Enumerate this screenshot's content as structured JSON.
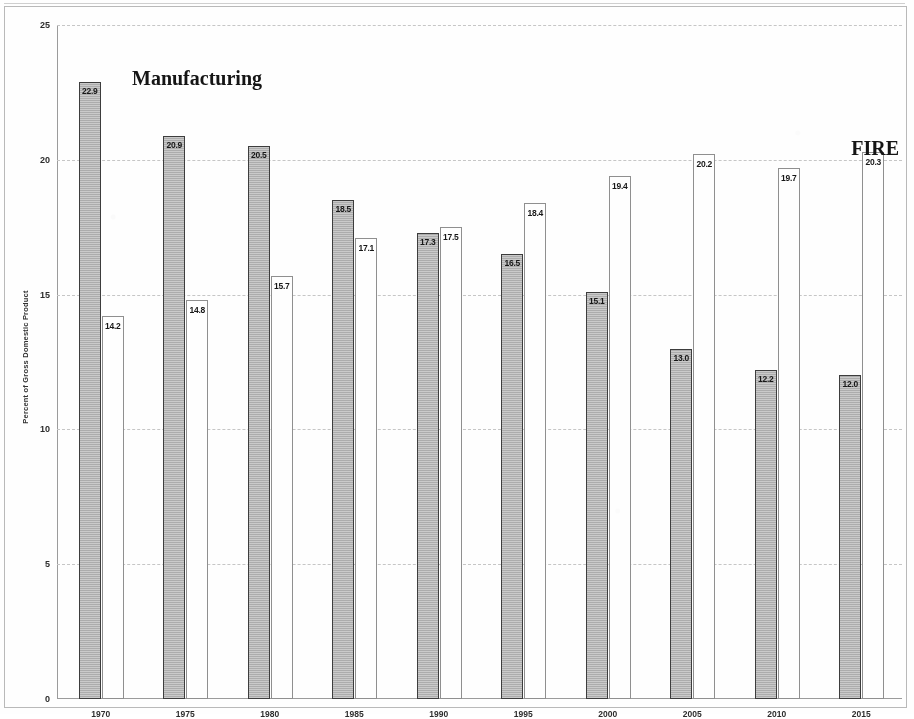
{
  "chart_data": {
    "type": "bar",
    "title": "",
    "xlabel": "",
    "ylabel": "Percent of Gross Domestic Product",
    "ylim": [
      0,
      25
    ],
    "yticks": [
      0,
      5,
      10,
      15,
      20,
      25
    ],
    "ytick_labels": [
      "0",
      "5",
      "10",
      "15",
      "20",
      "25"
    ],
    "grid": true,
    "legend_position": "inline-annotation",
    "categories": [
      "1970",
      "1975",
      "1980",
      "1985",
      "1990",
      "1995",
      "2000",
      "2005",
      "2010",
      "2015"
    ],
    "series": [
      {
        "name": "Manufacturing",
        "color": "#b5b5b5",
        "values": [
          22.9,
          20.9,
          20.5,
          18.5,
          17.3,
          16.5,
          15.1,
          13.0,
          12.2,
          12.0
        ],
        "labels": [
          "22.9",
          "20.9",
          "20.5",
          "18.5",
          "17.3",
          "16.5",
          "15.1",
          "13.0",
          "12.2",
          "12.0"
        ]
      },
      {
        "name": "FIRE",
        "color": "#ffffff",
        "values": [
          14.2,
          14.8,
          15.7,
          17.1,
          17.5,
          18.4,
          19.4,
          20.2,
          19.7,
          20.3
        ],
        "labels": [
          "14.2",
          "14.8",
          "15.7",
          "17.1",
          "17.5",
          "18.4",
          "19.4",
          "20.2",
          "19.7",
          "20.3"
        ]
      }
    ],
    "annotations": [
      {
        "name": "manufacturing-series-title",
        "text": "Manufacturing"
      },
      {
        "name": "fire-series-title",
        "text": "FIRE"
      }
    ]
  }
}
